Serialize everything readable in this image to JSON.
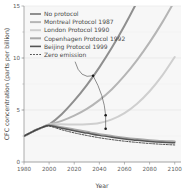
{
  "chart_data": {
    "type": "line",
    "title": "",
    "xlabel": "Year",
    "ylabel": "CFC concentration (parts per billion)",
    "xlim": [
      1980,
      2105
    ],
    "ylim": [
      0,
      15
    ],
    "xticks": [
      1980,
      2000,
      2020,
      2040,
      2060,
      2080,
      2100
    ],
    "xtick_labels": [
      "1980",
      "2000",
      "2020",
      "2040",
      "2060",
      "2080",
      "2100"
    ],
    "yticks": [
      0,
      5,
      10,
      15
    ],
    "ytick_labels": [
      "0",
      "5",
      "10",
      "15"
    ],
    "grid": "horizontal-faint",
    "legend_position": "upper-left",
    "x": [
      1980,
      1985,
      1990,
      1995,
      2000,
      2010,
      2020,
      2030,
      2040,
      2050,
      2060,
      2070,
      2080,
      2090,
      2100
    ],
    "series": [
      {
        "name": "No protocol",
        "color": "#8f8f8f",
        "style": "solid",
        "values": [
          2.5,
          2.8,
          3.1,
          3.35,
          3.6,
          4.6,
          5.9,
          7.4,
          9.1,
          11.0,
          13.1,
          15.4,
          17.9,
          20.6,
          23.5
        ]
      },
      {
        "name": "Montreal Protocol 1987",
        "color": "#b5b5b5",
        "style": "solid",
        "values": [
          2.5,
          2.8,
          3.1,
          3.35,
          3.6,
          3.95,
          4.45,
          5.1,
          5.95,
          7.0,
          8.3,
          9.8,
          11.5,
          13.4,
          15.5
        ]
      },
      {
        "name": "London Protocol 1990",
        "color": "#cfcfcf",
        "style": "solid",
        "values": [
          2.5,
          2.8,
          3.1,
          3.35,
          3.6,
          3.62,
          3.6,
          3.62,
          3.75,
          4.1,
          4.7,
          5.6,
          6.8,
          8.3,
          10.1
        ]
      },
      {
        "name": "Copenhagen Protocol 1992",
        "color": "#a8a8a8",
        "style": "solid",
        "values": [
          2.5,
          2.8,
          3.1,
          3.35,
          3.55,
          3.35,
          3.12,
          2.9,
          2.68,
          2.5,
          2.33,
          2.2,
          2.1,
          2.02,
          1.98
        ]
      },
      {
        "name": "Beijing Protocol 1999",
        "color": "#555555",
        "style": "solid",
        "values": [
          2.5,
          2.8,
          3.1,
          3.35,
          3.5,
          3.25,
          3.0,
          2.78,
          2.56,
          2.38,
          2.22,
          2.08,
          1.98,
          1.9,
          1.85
        ]
      },
      {
        "name": "Zero emission",
        "color": "#3c3c3c",
        "style": "dashed",
        "values": [
          2.5,
          2.8,
          3.1,
          3.35,
          3.45,
          3.1,
          2.8,
          2.55,
          2.33,
          2.15,
          2.0,
          1.88,
          1.78,
          1.7,
          1.64
        ]
      }
    ],
    "annotations": [
      {
        "name": "arrow-upper",
        "point_x": 2035,
        "point_y": 8.3
      },
      {
        "name": "arrow-middle",
        "point_x": 2045,
        "point_y": 4.5
      },
      {
        "name": "arrow-lower",
        "point_x": 2045,
        "point_y": 3.2
      }
    ]
  },
  "legend": {
    "items": [
      {
        "label": "No protocol"
      },
      {
        "label": "Montreal Protocol 1987"
      },
      {
        "label": "London Protocol 1990"
      },
      {
        "label": "Copenhagen Protocol 1992"
      },
      {
        "label": "Beijing Protocol 1999"
      },
      {
        "label": "Zero emission"
      }
    ]
  }
}
